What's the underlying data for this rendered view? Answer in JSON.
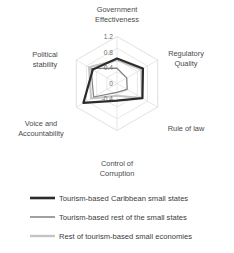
{
  "chart_data": {
    "type": "radar",
    "title": "",
    "categories": [
      "Government Effectiveness",
      "Regulatory Quality",
      "Rule of law",
      "Control of Corruption",
      "Voice and Accountability",
      "Political stability"
    ],
    "tick_labels": [
      "1.2",
      "0.8",
      "0.4",
      "0",
      "-0.4"
    ],
    "tick_values": [
      1.2,
      0.8,
      0.4,
      0,
      -0.4
    ],
    "rlim": [
      -0.4,
      1.2
    ],
    "grid": true,
    "legend_position": "bottom",
    "series": [
      {
        "name": "Tourism-based Caribbean small states",
        "color": "#2b2b2b",
        "width": 2.2,
        "values": [
          0.45,
          0.62,
          0.6,
          0.18,
          0.92,
          0.55
        ]
      },
      {
        "name": "Tourism-based rest of the small states",
        "color": "#808080",
        "width": 1.2,
        "values": [
          0.12,
          -0.02,
          0.0,
          -0.1,
          0.52,
          0.62
        ]
      },
      {
        "name": "Rest of tourism-based small economies",
        "color": "#c4c4c4",
        "width": 2.0,
        "values": [
          0.4,
          0.55,
          0.58,
          0.02,
          0.62,
          0.7
        ]
      }
    ]
  },
  "axis_labels": {
    "government_effectiveness_line1": "Government",
    "government_effectiveness_line2": "Effectiveness",
    "regulatory_quality_line1": "Regulatory",
    "regulatory_quality_line2": "Quality",
    "rule_of_law": "Rule of law",
    "control_of_corruption_line1": "Control of",
    "control_of_corruption_line2": "Corruption",
    "voice_and_accountability_line1": "Voice and",
    "voice_and_accountability_line2": "Accountability",
    "political_stability_line1": "Political",
    "political_stability_line2": "stability"
  },
  "ticks": {
    "t0": "1.2",
    "t1": "0.8",
    "t2": "0.4",
    "t3": "0",
    "t4": "-0.4"
  },
  "legend": {
    "item0": "Tourism-based Caribbean small states",
    "item1": "Tourism-based rest of the small states",
    "item2": "Rest of tourism-based small economies"
  }
}
